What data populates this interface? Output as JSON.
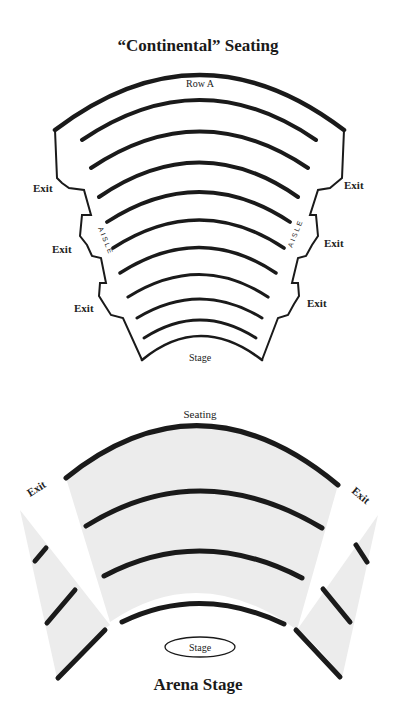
{
  "continental": {
    "title": "“Continental” Seating",
    "row_label": "Row A",
    "stage_label": "Stage",
    "aisle_left": "AISLE",
    "aisle_right": "AISLE",
    "exits_left": [
      "Exit",
      "Exit",
      "Exit"
    ],
    "exits_right": [
      "Exit",
      "Exit",
      "Exit"
    ],
    "row_count": 10
  },
  "arena": {
    "title": "Arena Stage",
    "seating_label": "Seating",
    "stage_label": "Stage",
    "exit_left": "Exit",
    "exit_right": "Exit",
    "row_count": 4
  },
  "colors": {
    "ink": "#1a1a1a",
    "seating_fill": "#ececec",
    "background": "#ffffff"
  }
}
